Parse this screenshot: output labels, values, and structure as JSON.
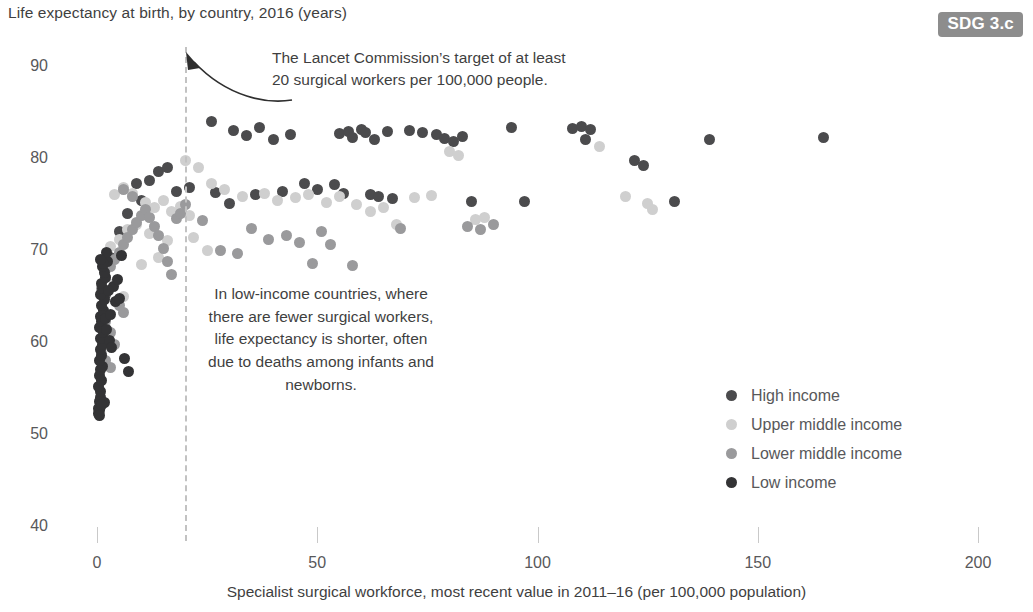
{
  "title": "Life expectancy at birth, by country, 2016 (years)",
  "badge": {
    "label": "SDG 3.c",
    "color": "#8d8d8d"
  },
  "annotations": {
    "target_line_1": "The Lancet Commission’s target of at least",
    "target_line_2": "20 surgical workers per 100,000 people.",
    "low_income_note": "In low-income countries, where there are fewer surgical workers, life expectancy is shorter, often due to deaths among infants and newborns."
  },
  "legend": {
    "items": [
      {
        "label": "High income",
        "color": "#4b4b4d"
      },
      {
        "label": "Upper middle income",
        "color": "#cfcfcf"
      },
      {
        "label": "Lower middle income",
        "color": "#9a9a9c"
      },
      {
        "label": "Low income",
        "color": "#333335"
      }
    ]
  },
  "chart_data": {
    "type": "scatter",
    "title": "Life expectancy at birth, by country, 2016 (years)",
    "xlabel": "Specialist surgical workforce, most recent value in 2011–16 (per 100,000 population)",
    "ylabel": "Life expectancy at birth, by country, 2016 (years)",
    "xlim": [
      0,
      200
    ],
    "ylim": [
      40,
      92
    ],
    "xticks": [
      0,
      50,
      100,
      150,
      200
    ],
    "yticks": [
      40,
      50,
      60,
      70,
      80,
      90
    ],
    "grid": false,
    "legend_position": "center-right",
    "reference_lines": [
      {
        "axis": "x",
        "value": 20,
        "style": "dashed",
        "color": "#c2c2c2",
        "label": "The Lancet Commission’s target of at least 20 surgical workers per 100,000 people."
      }
    ],
    "series": [
      {
        "name": "High income",
        "color": "#4b4b4d",
        "points": [
          [
            26,
            84.2
          ],
          [
            31,
            83.2
          ],
          [
            34,
            82.7
          ],
          [
            37,
            83.5
          ],
          [
            40,
            82.2
          ],
          [
            44,
            82.8
          ],
          [
            55,
            82.9
          ],
          [
            57,
            83.1
          ],
          [
            58,
            82.5
          ],
          [
            60,
            83.3
          ],
          [
            61,
            83.0
          ],
          [
            63,
            82.2
          ],
          [
            66,
            83.1
          ],
          [
            71,
            83.2
          ],
          [
            74,
            83.0
          ],
          [
            77,
            82.8
          ],
          [
            79,
            82.3
          ],
          [
            81,
            82.0
          ],
          [
            83,
            82.6
          ],
          [
            94,
            83.5
          ],
          [
            108,
            83.4
          ],
          [
            110,
            83.6
          ],
          [
            112,
            83.3
          ],
          [
            111,
            82.2
          ],
          [
            122,
            80.0
          ],
          [
            124,
            79.4
          ],
          [
            139,
            82.2
          ],
          [
            165,
            82.4
          ],
          [
            21,
            77.0
          ],
          [
            27,
            76.5
          ],
          [
            30,
            75.3
          ],
          [
            36,
            76.2
          ],
          [
            42,
            76.6
          ],
          [
            47,
            77.4
          ],
          [
            50,
            76.8
          ],
          [
            54,
            77.3
          ],
          [
            56,
            76.4
          ],
          [
            62,
            76.2
          ],
          [
            64,
            76.0
          ],
          [
            67,
            75.8
          ],
          [
            85,
            75.5
          ],
          [
            97,
            75.5
          ],
          [
            131,
            75.5
          ],
          [
            14,
            78.8
          ],
          [
            16,
            79.2
          ],
          [
            12,
            77.8
          ],
          [
            9,
            77.4
          ],
          [
            18,
            76.6
          ],
          [
            10,
            75.6
          ],
          [
            7,
            74.2
          ],
          [
            5,
            72.2
          ],
          [
            3,
            69.4
          ],
          [
            2,
            65.4
          ]
        ]
      },
      {
        "name": "Upper middle income",
        "color": "#cfcfcf",
        "points": [
          [
            20,
            80.0
          ],
          [
            23,
            79.2
          ],
          [
            26,
            77.5
          ],
          [
            29,
            76.8
          ],
          [
            33,
            76.0
          ],
          [
            38,
            76.4
          ],
          [
            41,
            75.6
          ],
          [
            45,
            75.9
          ],
          [
            48,
            76.2
          ],
          [
            52,
            75.4
          ],
          [
            55,
            76.0
          ],
          [
            59,
            75.2
          ],
          [
            62,
            74.4
          ],
          [
            65,
            74.8
          ],
          [
            68,
            73.0
          ],
          [
            72,
            75.9
          ],
          [
            76,
            76.1
          ],
          [
            80,
            80.9
          ],
          [
            82,
            80.5
          ],
          [
            86,
            73.5
          ],
          [
            88,
            73.8
          ],
          [
            114,
            81.5
          ],
          [
            120,
            76.0
          ],
          [
            125,
            75.3
          ],
          [
            126,
            74.6
          ],
          [
            4,
            76.2
          ],
          [
            6,
            77.0
          ],
          [
            8,
            76.4
          ],
          [
            11,
            75.4
          ],
          [
            13,
            74.8
          ],
          [
            15,
            75.6
          ],
          [
            17,
            74.4
          ],
          [
            19,
            75.0
          ],
          [
            21,
            74.0
          ],
          [
            9,
            73.0
          ],
          [
            5,
            71.4
          ],
          [
            3,
            70.6
          ],
          [
            7,
            72.4
          ],
          [
            12,
            72.0
          ],
          [
            16,
            71.2
          ],
          [
            22,
            71.6
          ],
          [
            2,
            68.0
          ],
          [
            4,
            66.6
          ],
          [
            6,
            65.2
          ],
          [
            1,
            63.0
          ],
          [
            10,
            68.6
          ],
          [
            14,
            69.4
          ],
          [
            25,
            70.2
          ]
        ]
      },
      {
        "name": "Lower middle income",
        "color": "#9a9a9c",
        "points": [
          [
            24,
            73.4
          ],
          [
            28,
            70.2
          ],
          [
            32,
            69.8
          ],
          [
            35,
            72.6
          ],
          [
            39,
            71.4
          ],
          [
            43,
            71.8
          ],
          [
            46,
            71.0
          ],
          [
            49,
            68.8
          ],
          [
            51,
            72.2
          ],
          [
            53,
            70.8
          ],
          [
            58,
            68.5
          ],
          [
            69,
            72.6
          ],
          [
            84,
            72.8
          ],
          [
            87,
            72.4
          ],
          [
            90,
            73.0
          ],
          [
            1,
            66.0
          ],
          [
            2,
            67.2
          ],
          [
            3,
            68.4
          ],
          [
            4,
            69.2
          ],
          [
            5,
            70.0
          ],
          [
            6,
            70.8
          ],
          [
            7,
            71.6
          ],
          [
            8,
            72.4
          ],
          [
            9,
            73.2
          ],
          [
            10,
            74.0
          ],
          [
            11,
            74.6
          ],
          [
            12,
            73.8
          ],
          [
            13,
            72.8
          ],
          [
            14,
            71.8
          ],
          [
            15,
            70.4
          ],
          [
            16,
            69.0
          ],
          [
            17,
            67.6
          ],
          [
            18,
            73.6
          ],
          [
            19,
            74.2
          ],
          [
            20,
            75.2
          ],
          [
            2,
            62.4
          ],
          [
            3,
            61.2
          ],
          [
            4,
            60.0
          ],
          [
            5,
            64.2
          ],
          [
            6,
            63.4
          ],
          [
            1,
            59.0
          ],
          [
            2,
            58.2
          ],
          [
            3,
            57.4
          ],
          [
            8,
            76.0
          ],
          [
            6,
            76.8
          ]
        ]
      },
      {
        "name": "Low income",
        "color": "#333335",
        "points": [
          [
            0.4,
            52.4
          ],
          [
            0.6,
            52.8
          ],
          [
            0.8,
            53.2
          ],
          [
            0.5,
            53.8
          ],
          [
            0.7,
            54.2
          ],
          [
            0.9,
            54.8
          ],
          [
            0.3,
            55.4
          ],
          [
            1.1,
            56.0
          ],
          [
            0.6,
            56.6
          ],
          [
            0.8,
            57.2
          ],
          [
            1.3,
            57.6
          ],
          [
            0.5,
            58.2
          ],
          [
            1.0,
            58.8
          ],
          [
            0.7,
            59.4
          ],
          [
            1.2,
            60.0
          ],
          [
            0.9,
            60.6
          ],
          [
            1.5,
            61.2
          ],
          [
            0.6,
            61.8
          ],
          [
            1.1,
            62.4
          ],
          [
            0.8,
            63.0
          ],
          [
            1.4,
            63.6
          ],
          [
            1.0,
            64.2
          ],
          [
            1.7,
            64.8
          ],
          [
            0.9,
            65.4
          ],
          [
            1.3,
            66.0
          ],
          [
            1.1,
            66.6
          ],
          [
            2.0,
            67.2
          ],
          [
            1.6,
            67.8
          ],
          [
            1.2,
            68.4
          ],
          [
            2.4,
            69.0
          ],
          [
            1.9,
            62.8
          ],
          [
            2.2,
            61.6
          ],
          [
            2.8,
            60.4
          ],
          [
            3.4,
            59.6
          ],
          [
            4.2,
            64.6
          ],
          [
            5.0,
            65.0
          ],
          [
            6.2,
            58.4
          ],
          [
            3.0,
            63.2
          ],
          [
            3.8,
            66.2
          ],
          [
            4.6,
            67.0
          ],
          [
            2.6,
            65.8
          ],
          [
            0.4,
            53.0
          ],
          [
            0.5,
            52.2
          ],
          [
            1.8,
            53.6
          ],
          [
            1.0,
            53.4
          ],
          [
            5.6,
            69.6
          ],
          [
            7.2,
            57.0
          ],
          [
            2.1,
            70.0
          ],
          [
            1.4,
            68.8
          ],
          [
            0.8,
            69.2
          ]
        ]
      }
    ]
  }
}
